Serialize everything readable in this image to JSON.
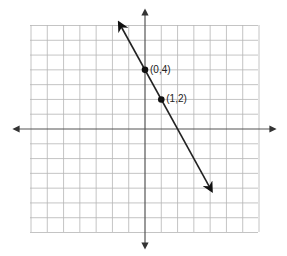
{
  "chart_data": {
    "type": "line",
    "title": "",
    "xlabel": "",
    "ylabel": "",
    "grid": true,
    "xlim": [
      -7,
      7
    ],
    "ylim": [
      -7,
      7
    ],
    "series": [
      {
        "name": "y = -2x + 4",
        "slope": -2,
        "intercept": 4,
        "x": [
          -1.5,
          4
        ],
        "y": [
          7,
          -4
        ]
      }
    ],
    "points": [
      {
        "x": 0,
        "y": 4,
        "label": "(0,4)"
      },
      {
        "x": 1,
        "y": 2,
        "label": "(1,2)"
      }
    ]
  },
  "colors": {
    "grid": "#b5b5b5",
    "axis": "#555555",
    "line": "#222222",
    "point": "#111111"
  }
}
